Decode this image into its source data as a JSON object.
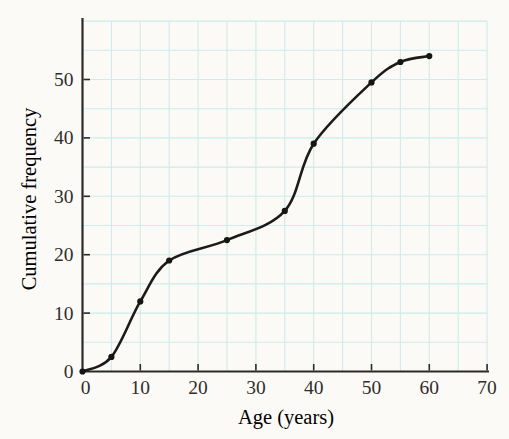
{
  "figure": {
    "background": "#fbfaf7"
  },
  "chart_data": {
    "type": "line",
    "subtype": "cumulative-frequency-ogive",
    "title": "",
    "xlabel": "Age (years)",
    "ylabel": "Cumulative frequency",
    "x": [
      0,
      5,
      10,
      15,
      25,
      35,
      40,
      50,
      55,
      60
    ],
    "y": [
      0,
      2.5,
      12,
      19,
      22.5,
      27.5,
      39,
      49.5,
      53,
      54
    ],
    "xlim": [
      0,
      70
    ],
    "ylim": [
      0,
      60.5
    ],
    "x_ticks": [
      0,
      10,
      20,
      30,
      40,
      50,
      60,
      70
    ],
    "y_ticks": [
      0,
      10,
      20,
      30,
      40,
      50
    ],
    "grid": {
      "on": true,
      "step": 5,
      "x_max": 70,
      "y_max": 60,
      "color": "#cdecea"
    },
    "legend": "none",
    "style": {
      "curve_color": "#1d1b1a",
      "point_color": "#171514",
      "axis_color": "#2b2a28",
      "text_color": "#2f2d2a",
      "curve_width": 2.6,
      "point_radius": 3.1
    }
  }
}
